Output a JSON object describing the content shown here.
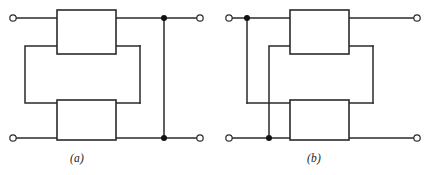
{
  "figure": {
    "type": "circuit-diagram",
    "background_color": "#ffffff",
    "line_color": "#2a2a2a",
    "node_color": "#111111",
    "terminal_fill": "#ffffff"
  },
  "captions": {
    "a": "(a)",
    "b": "(b)"
  },
  "circuits": [
    {
      "id": "a",
      "label": "(a)",
      "blocks": [
        {
          "name": "top-network-block-a",
          "x": 57,
          "y": 10,
          "w": 59,
          "h": 44
        },
        {
          "name": "bottom-network-block-a",
          "x": 57,
          "y": 100,
          "w": 59,
          "h": 40
        }
      ],
      "terminals": [
        {
          "name": "terminal-top-left-a",
          "cx": 13,
          "cy": 18,
          "r": 3.2
        },
        {
          "name": "terminal-top-right-a",
          "cx": 200,
          "cy": 18,
          "r": 3.2
        },
        {
          "name": "terminal-bottom-left-a",
          "cx": 13,
          "cy": 138,
          "r": 3.2
        },
        {
          "name": "terminal-bottom-right-a",
          "cx": 200,
          "cy": 138,
          "r": 3.2
        }
      ],
      "junctions": [
        {
          "name": "junction-top-right-a",
          "cx": 164,
          "cy": 18,
          "r": 3.0
        },
        {
          "name": "junction-bottom-right-a",
          "cx": 164,
          "cy": 138,
          "r": 3.0
        }
      ],
      "wires": [
        {
          "name": "wire-top-left-lead-a",
          "points": "16,18 57,18"
        },
        {
          "name": "wire-top-right-lead-a",
          "points": "116,18 197,18"
        },
        {
          "name": "wire-bottom-left-lead-a",
          "points": "16,138 57,138"
        },
        {
          "name": "wire-bottom-right-lead-a",
          "points": "116,138 197,138"
        },
        {
          "name": "wire-right-vertical-a",
          "points": "164,18 164,138"
        },
        {
          "name": "wire-middle-loop-a",
          "points": "57,46 25,46 25,103 57,103"
        },
        {
          "name": "wire-middle-upper-right-a",
          "points": "116,46 140,46"
        },
        {
          "name": "wire-middle-lower-right-a",
          "points": "116,103 140,103"
        },
        {
          "name": "wire-middle-right-vertical-a",
          "points": "140,46 140,103"
        }
      ]
    },
    {
      "id": "b",
      "label": "(b)",
      "blocks": [
        {
          "name": "top-network-block-b",
          "x": 290,
          "y": 10,
          "w": 59,
          "h": 44
        },
        {
          "name": "bottom-network-block-b",
          "x": 290,
          "y": 100,
          "w": 59,
          "h": 40
        }
      ],
      "terminals": [
        {
          "name": "terminal-top-left-b",
          "cx": 229,
          "cy": 18,
          "r": 3.2
        },
        {
          "name": "terminal-top-right-b",
          "cx": 417,
          "cy": 18,
          "r": 3.2
        },
        {
          "name": "terminal-bottom-left-b",
          "cx": 229,
          "cy": 138,
          "r": 3.2
        },
        {
          "name": "terminal-bottom-right-b",
          "cx": 417,
          "cy": 138,
          "r": 3.2
        }
      ],
      "junctions": [
        {
          "name": "junction-top-left-b",
          "cx": 247,
          "cy": 18,
          "r": 3.0
        },
        {
          "name": "junction-bottom-left-b",
          "cx": 269,
          "cy": 138,
          "r": 3.0
        }
      ],
      "wires": [
        {
          "name": "wire-top-left-lead-b",
          "points": "232,18 290,18"
        },
        {
          "name": "wire-top-right-lead-b",
          "points": "349,18 414,18"
        },
        {
          "name": "wire-bottom-left-lead-b",
          "points": "232,138 290,138"
        },
        {
          "name": "wire-bottom-right-lead-b",
          "points": "349,138 414,138"
        },
        {
          "name": "wire-left-vertical-b",
          "points": "247,18 247,103"
        },
        {
          "name": "wire-left-lower-horizontal-b",
          "points": "247,103 290,103"
        },
        {
          "name": "wire-middle-loop-b",
          "points": "290,46 269,46 269,138"
        },
        {
          "name": "wire-middle-upper-right-b",
          "points": "349,46 373,46"
        },
        {
          "name": "wire-middle-lower-right-b",
          "points": "349,103 373,103"
        },
        {
          "name": "wire-middle-right-vertical-b",
          "points": "373,46 373,103"
        }
      ]
    }
  ]
}
